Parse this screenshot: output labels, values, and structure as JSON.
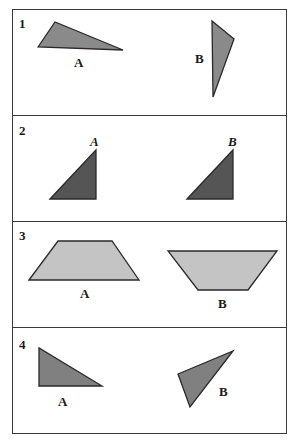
{
  "colors": {
    "border": "#3a3a3a",
    "fill_medium": "#8a8a8a",
    "fill_dark": "#555555",
    "fill_light": "#c4c4c4",
    "fill_medium_dark": "#808080"
  },
  "panels": [
    {
      "number": "1",
      "shape_type": "triangle",
      "figures": [
        {
          "label": "A",
          "points": "38,47 55,22 123,50",
          "fill": "#8a8a8a",
          "label_x": 74,
          "label_y": 67,
          "italic": false
        },
        {
          "label": "B",
          "points": "212,21 234,39 213,97",
          "fill": "#8a8a8a",
          "label_x": 195,
          "label_y": 63,
          "italic": false
        }
      ]
    },
    {
      "number": "2",
      "shape_type": "right-triangle",
      "figures": [
        {
          "label": "A",
          "points": "50,199 96,150 96,199",
          "fill": "#555555",
          "label_x": 90,
          "label_y": 146,
          "italic": true
        },
        {
          "label": "B",
          "points": "187,199 233,150 233,199",
          "fill": "#555555",
          "label_x": 228,
          "label_y": 146,
          "italic": true
        }
      ]
    },
    {
      "number": "3",
      "shape_type": "trapezoid",
      "figures": [
        {
          "label": "A",
          "points": "29,280 58,241 112,241 139,280",
          "fill": "#c4c4c4",
          "label_x": 80,
          "label_y": 298,
          "italic": false
        },
        {
          "label": "B",
          "points": "168,251 277,251 248,290 198,290",
          "fill": "#c4c4c4",
          "label_x": 218,
          "label_y": 308,
          "italic": false
        }
      ]
    },
    {
      "number": "4",
      "shape_type": "triangle",
      "figures": [
        {
          "label": "A",
          "points": "39,348 39,386 102,386",
          "fill": "#808080",
          "label_x": 58,
          "label_y": 406,
          "italic": false
        },
        {
          "label": "B",
          "points": "178,374 233,351 190,407",
          "fill": "#808080",
          "label_x": 219,
          "label_y": 396,
          "italic": false
        }
      ]
    }
  ]
}
